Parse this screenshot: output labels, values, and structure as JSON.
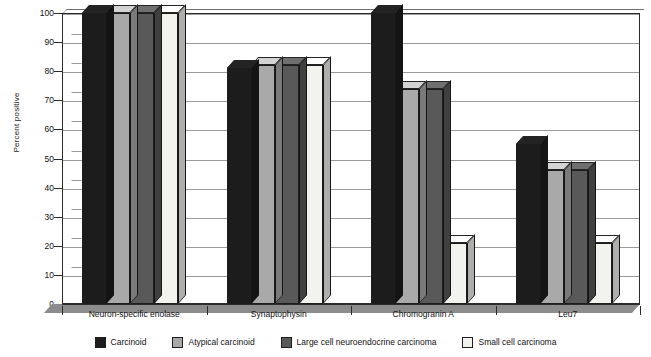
{
  "chart_data": {
    "type": "bar",
    "title": "",
    "xlabel": "",
    "ylabel": "Percent positive",
    "ylim": [
      0,
      100
    ],
    "yticks": [
      0,
      10,
      20,
      30,
      40,
      50,
      60,
      70,
      80,
      90,
      100
    ],
    "grid": true,
    "legend_position": "bottom",
    "categories": [
      "Neuron-specific enolase",
      "Synaptophysin",
      "Chromogranin A",
      "Leu7"
    ],
    "series": [
      {
        "name": "Carcinoid",
        "color": "#1c1c1c",
        "values": [
          100,
          81,
          100,
          55
        ]
      },
      {
        "name": "Atypical carcinoid",
        "color": "#a9a9a9",
        "values": [
          100,
          82,
          74,
          46
        ]
      },
      {
        "name": "Large cell neuroendocrine carcinoma",
        "color": "#595959",
        "values": [
          100,
          82,
          74,
          46
        ]
      },
      {
        "name": "Small cell carcinoma",
        "color": "#f2f2ee",
        "values": [
          100,
          82,
          21,
          21
        ]
      }
    ]
  },
  "caption": ""
}
